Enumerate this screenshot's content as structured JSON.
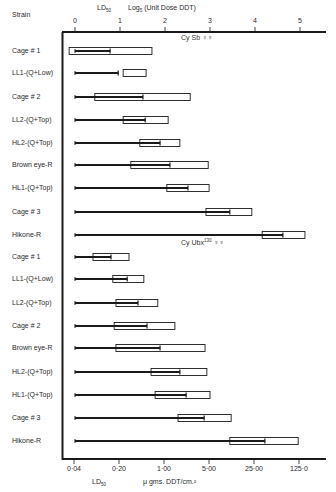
{
  "chart_data": {
    "type": "bar",
    "subtype": "horizontal range (box = LD50 range, line = dose)",
    "header": {
      "strain_label": "Strain",
      "ld_label": "LD",
      "ld_sub": "50",
      "top_axis_label": "Log",
      "top_axis_sub": "5",
      "top_axis_label_rest": " (Unit Dose DDT)"
    },
    "top_axis": {
      "ticks": [
        "0",
        "1",
        "2",
        "3",
        "4",
        "5"
      ],
      "range": [
        0,
        5
      ],
      "scale": "log5 units"
    },
    "bottom_axis": {
      "label_ld": "LD",
      "label_ld_sub": "50",
      "label": "μ gms. DDT/cm.²",
      "ticks": [
        "0·04",
        "0·20",
        "1·00",
        "5·00",
        "25·00",
        "125·0"
      ]
    },
    "groups": [
      {
        "name": "Cy Sb ♀♀",
        "annotation": "Cy Sb ♀♀",
        "rows": [
          {
            "strain": "Cage # 1",
            "line_start": 0,
            "line_end": 0.78,
            "box": [
              -0.13,
              1.71
            ]
          },
          {
            "strain": "LL1-(Q+Low)",
            "line_start": 0,
            "line_end": 0.96,
            "box": [
              1.07,
              1.58
            ]
          },
          {
            "strain": "Cage # 2",
            "line_start": 0,
            "line_end": 1.51,
            "box": [
              0.44,
              2.56
            ]
          },
          {
            "strain": "LL2-(Q+Top)",
            "line_start": 0,
            "line_end": 1.56,
            "box": [
              1.07,
              2.07
            ]
          },
          {
            "strain": "HL2-(Q+Top)",
            "line_start": 0,
            "line_end": 1.89,
            "box": [
              1.44,
              2.33
            ]
          },
          {
            "strain": "Brown eye-R",
            "line_start": 0,
            "line_end": 2.11,
            "box": [
              1.24,
              2.96
            ]
          },
          {
            "strain": "HL1-(Q+Top)",
            "line_start": 0,
            "line_end": 2.51,
            "box": [
              2.04,
              2.98
            ]
          },
          {
            "strain": "Cage # 3",
            "line_start": 0,
            "line_end": 3.44,
            "box": [
              2.91,
              3.93
            ]
          },
          {
            "strain": "Hikone-R",
            "line_start": 0,
            "line_end": 4.62,
            "box": [
              4.16,
              5.11
            ]
          }
        ]
      },
      {
        "name": "Cy Ubx130 ♀♀",
        "annotation": "Cy Ubx",
        "annotation_sup": "130",
        "annotation_tail": " ♀♀",
        "rows": [
          {
            "strain": "Cage # 1",
            "line_start": 0,
            "line_end": 0.8,
            "box": [
              0.4,
              1.2
            ]
          },
          {
            "strain": "LL1-(Q+Low)",
            "line_start": 0,
            "line_end": 1.16,
            "box": [
              0.84,
              1.53
            ]
          },
          {
            "strain": "LL2-(Q+Top)",
            "line_start": 0,
            "line_end": 1.4,
            "box": [
              0.91,
              1.84
            ]
          },
          {
            "strain": "Cage # 2",
            "line_start": 0,
            "line_end": 1.6,
            "box": [
              0.87,
              2.22
            ]
          },
          {
            "strain": "Brown eye-R",
            "line_start": 0,
            "line_end": 1.89,
            "box": [
              0.91,
              2.89
            ]
          },
          {
            "strain": "HL2-(Q+Top)",
            "line_start": 0,
            "line_end": 2.33,
            "box": [
              1.69,
              2.93
            ]
          },
          {
            "strain": "HL1-(Q+Top)",
            "line_start": 0,
            "line_end": 2.47,
            "box": [
              1.78,
              3.0
            ]
          },
          {
            "strain": "Cage # 3",
            "line_start": 0,
            "line_end": 2.87,
            "box": [
              2.29,
              3.47
            ]
          },
          {
            "strain": "Hikone-R",
            "line_start": 0,
            "line_end": 4.22,
            "box": [
              3.44,
              4.96
            ]
          }
        ]
      }
    ],
    "grid": false,
    "colors": {
      "line": "#1a1a1a",
      "box_stroke": "#1a1a1a",
      "box_fill": "#ffffff",
      "background": "#ffffff"
    }
  }
}
